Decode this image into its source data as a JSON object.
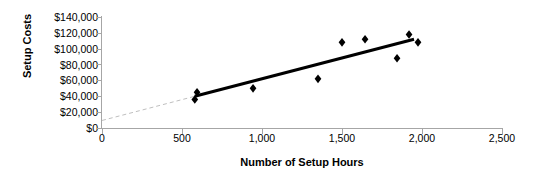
{
  "chart_data": {
    "type": "scatter",
    "title": "",
    "xlabel": "Number of Setup Hours",
    "ylabel": "Setup Costs",
    "xlim": [
      0,
      2500
    ],
    "ylim": [
      0,
      140000
    ],
    "grid": false,
    "legend": "none",
    "x_ticks": [
      "0",
      "500",
      "1,000",
      "1,500",
      "2,000",
      "2,500"
    ],
    "x_tick_values": [
      0,
      500,
      1000,
      1500,
      2000,
      2500
    ],
    "y_ticks": [
      "$0",
      "$20,000",
      "$40,000",
      "$60,000",
      "$80,000",
      "$100,000",
      "$120,000",
      "$140,000"
    ],
    "y_tick_values": [
      0,
      20000,
      40000,
      60000,
      80000,
      100000,
      120000,
      140000
    ],
    "marker": "diamond",
    "marker_color": "#000000",
    "points": [
      {
        "x": 580,
        "y": 36000
      },
      {
        "x": 594,
        "y": 45000
      },
      {
        "x": 944,
        "y": 50000
      },
      {
        "x": 1350,
        "y": 62000
      },
      {
        "x": 1500,
        "y": 108000
      },
      {
        "x": 1644,
        "y": 112000
      },
      {
        "x": 1844,
        "y": 88000
      },
      {
        "x": 1919,
        "y": 118000
      },
      {
        "x": 1975,
        "y": 108000
      }
    ],
    "series": [
      {
        "name": "Setup Costs",
        "x": [
          580,
          594,
          944,
          1350,
          1500,
          1644,
          1844,
          1919,
          1975
        ],
        "values": [
          36000,
          45000,
          50000,
          62000,
          108000,
          112000,
          88000,
          118000,
          108000
        ]
      }
    ],
    "trendline": {
      "name": "regression-line",
      "color": "#000000",
      "width": 3,
      "x_start": 580,
      "y_start": 40000,
      "x_end": 1950,
      "y_end": 112000
    },
    "trendline_extension": {
      "name": "extrapolated-dashed-segment",
      "color": "#bfbfbf",
      "width": 1,
      "dash": "4 3",
      "x_start": 0,
      "y_start": 9500,
      "x_end": 580,
      "y_end": 40000
    }
  }
}
